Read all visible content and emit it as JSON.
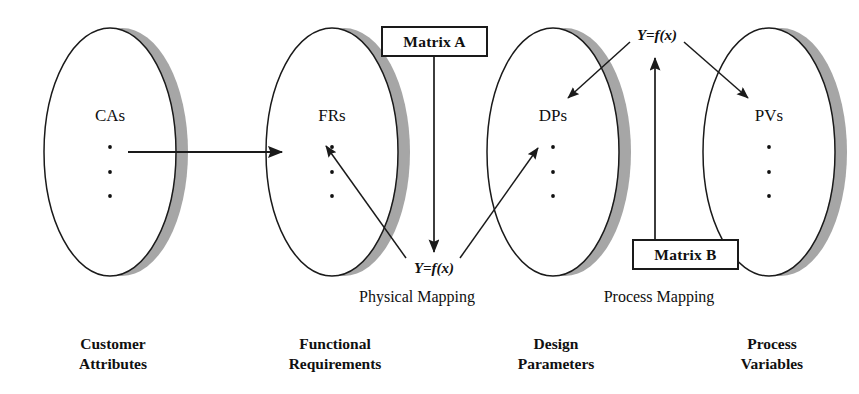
{
  "diagram": {
    "colors": {
      "ellipse_fill": "#ffffff",
      "ellipse_stroke": "#1a1a1a",
      "shadow_gray": "#a6a6a6",
      "text": "#101010",
      "arrow": "#1a1a1a"
    },
    "domains": [
      {
        "id": "ca",
        "set_label": "CAs",
        "dots": "...",
        "caption_line1": "Customer",
        "caption_line2": "Attributes"
      },
      {
        "id": "fr",
        "set_label": "FRs",
        "dots": "...",
        "caption_line1": "Functional",
        "caption_line2": "Requirements"
      },
      {
        "id": "dp",
        "set_label": "DPs",
        "dots": "...",
        "caption_line1": "Design",
        "caption_line2": "Parameters"
      },
      {
        "id": "pv",
        "set_label": "PVs",
        "dots": "...",
        "caption_line1": "Process",
        "caption_line2": "Variables"
      }
    ],
    "matrix_boxes": [
      {
        "id": "matrix-a",
        "label": "Matrix A"
      },
      {
        "id": "matrix-b",
        "label": "Matrix B"
      }
    ],
    "equations": [
      {
        "id": "eq-physical",
        "label": "Y=f(x)"
      },
      {
        "id": "eq-process",
        "label": "Y=f(x)"
      }
    ],
    "mappings": [
      {
        "id": "physical-mapping",
        "label": "Physical Mapping"
      },
      {
        "id": "process-mapping",
        "label": "Process Mapping"
      }
    ]
  }
}
